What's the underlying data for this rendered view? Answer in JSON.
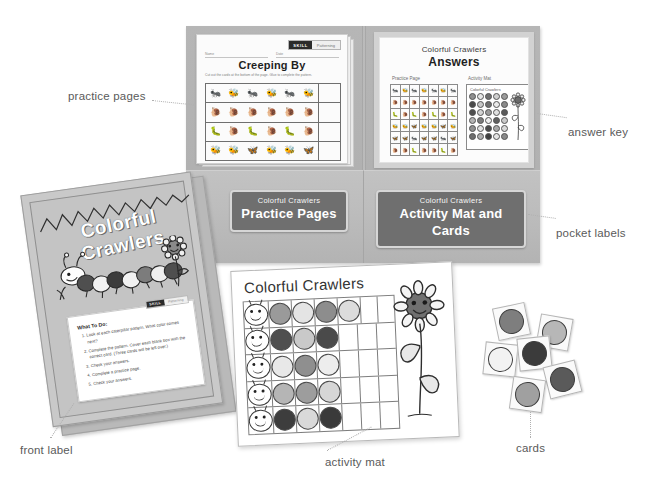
{
  "product": {
    "name": "Colorful Crawlers"
  },
  "callouts": [
    {
      "key": "practice-pages",
      "label": "practice pages"
    },
    {
      "key": "answer-key",
      "label": "answer key"
    },
    {
      "key": "pocket-labels",
      "label": "pocket labels"
    },
    {
      "key": "front-label",
      "label": "front label"
    },
    {
      "key": "activity-mat",
      "label": "activity mat"
    },
    {
      "key": "cards",
      "label": "cards"
    }
  ],
  "practice_page": {
    "skill_badge": {
      "label": "SKILL",
      "value": "Patterning"
    },
    "name_field": "Name",
    "date_field": "Date",
    "title": "Creeping By",
    "instructions": "Cut out the cards at the bottom of the page. Glue to complete the pattern.",
    "rows": [
      {
        "pattern": [
          "🐜",
          "🐝",
          "🐜",
          "🐝",
          "🐜",
          "🐝"
        ]
      },
      {
        "pattern": [
          "🐌",
          "🐌",
          "🐌",
          "🐌",
          "🐌",
          "🐌"
        ]
      },
      {
        "pattern": [
          "🐛",
          "🐌",
          "🐛",
          "🐌",
          "🐛",
          "🐌"
        ]
      },
      {
        "pattern": [
          "🐝",
          "🐝",
          "🦋",
          "🐝",
          "🐝",
          "🦋"
        ]
      }
    ]
  },
  "answer_key": {
    "brand": "Colorful Crawlers",
    "title": "Answers",
    "section_practice": "Practice Page",
    "section_mat": "Activity Mat",
    "mat_caption": "Colorful Crawlers",
    "mini_rows": [
      [
        "🐜",
        "🐝",
        "🐜",
        "🐝",
        "🐜",
        "🐝",
        "🐜"
      ],
      [
        "🐌",
        "🐌",
        "🐌",
        "🐌",
        "🐌",
        "🐌",
        "🐌"
      ],
      [
        "🐛",
        "🐌",
        "🐛",
        "🐌",
        "🐛",
        "🐌",
        "🐛"
      ],
      [
        "🐝",
        "🐝",
        "🦋",
        "🐝",
        "🐝",
        "🦋",
        "🐝"
      ],
      [
        "🦋",
        "🦋",
        "🐜",
        "🦋",
        "🦋",
        "🐜",
        "🦋"
      ],
      [
        "🐌",
        "🐌",
        "🐛",
        "🐌",
        "🐌",
        "🐛",
        "🐌"
      ]
    ],
    "mat_dot_colors": [
      "#8f8f8f",
      "#e6e6e6",
      "#6e6e6e",
      "#cfcfcf",
      "#9b9b9b",
      "#4a4a4a",
      "#c6c6c6",
      "#6e6e6e",
      "#eaeaea",
      "#8a8a8a",
      "#4f4f4f",
      "#d4d4d4",
      "#9b9b9b",
      "#e0e0e0",
      "#5a5a5a",
      "#b3b3b3",
      "#7b7b7b",
      "#efefef",
      "#5f5f5f",
      "#c9c9c9",
      "#8f8f8f",
      "#e3e3e3",
      "#4a4a4a",
      "#a8a8a8",
      "#d9d9d9",
      "#6e6e6e",
      "#b0b0b0",
      "#3f3f3f",
      "#e6e6e6",
      "#8a8a8a"
    ]
  },
  "pocket_labels": [
    {
      "sub": "Colorful Crawlers",
      "main": "Practice Pages"
    },
    {
      "sub": "Colorful Crawlers",
      "main": "Activity Mat and Cards"
    }
  ],
  "front_label": {
    "title": "Colorful Crawlers",
    "what_to_do": {
      "heading": "What To Do:",
      "skill_badge": {
        "label": "SKILL",
        "value": "Patterning"
      },
      "steps": [
        "Look at each caterpillar pattern. What color comes next?",
        "Complete the pattern. Cover each blank box with the correct card. (Three cards will be left over.)",
        "Check your answers.",
        "Complete a practice page.",
        "Check your answers."
      ]
    }
  },
  "activity_mat": {
    "title": "Colorful Crawlers",
    "rows": [
      {
        "head": "😀",
        "dots": [
          "#9a9a9a",
          "#e4e4e4",
          "#8d8d8d",
          "#dcdcdc",
          "",
          ""
        ]
      },
      {
        "head": "😀",
        "dots": [
          "#4f4f4f",
          "#c9c9c9",
          "#4a4a4a",
          "",
          "",
          ""
        ]
      },
      {
        "head": "😀",
        "dots": [
          "#e8e8e8",
          "#8f8f8f",
          "#ededed",
          "",
          "",
          ""
        ]
      },
      {
        "head": "😀",
        "dots": [
          "#b5b5b5",
          "#9d9d9d",
          "#d6d6d6",
          "",
          "",
          ""
        ]
      },
      {
        "head": "😀",
        "dots": [
          "#3d3d3d",
          "#d9d9d9",
          "#3a3a3a",
          "",
          "",
          ""
        ]
      }
    ]
  },
  "cards": [
    {
      "color": "#7e7e7e"
    },
    {
      "color": "#b7b7b7"
    },
    {
      "color": "#f2f2f2"
    },
    {
      "color": "#3b3b3b"
    },
    {
      "color": "#5a5a5a"
    },
    {
      "color": "#a0a0a0"
    }
  ],
  "colors": {
    "folder": "#b2b2b2",
    "pocket": "#bdbdbd",
    "label_bg": "#6f6f6f",
    "page": "#ffffff",
    "callout_text": "#5a5a5a",
    "leader": "#b0b0b0"
  }
}
